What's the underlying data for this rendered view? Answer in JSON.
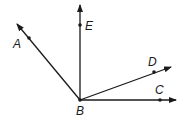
{
  "diagram": {
    "type": "rays-from-common-vertex",
    "vertex": {
      "label": "B",
      "x": 80,
      "y": 100,
      "label_x": 76,
      "label_y": 115
    },
    "rays": [
      {
        "id": "BA",
        "end_x": 17,
        "end_y": 24,
        "point": {
          "label": "A",
          "x": 29,
          "y": 38
        },
        "label_x": 13,
        "label_y": 48
      },
      {
        "id": "BE",
        "end_x": 80,
        "end_y": 5,
        "point": {
          "label": "E",
          "x": 80,
          "y": 25
        },
        "label_x": 85,
        "label_y": 30
      },
      {
        "id": "BD",
        "end_x": 171,
        "end_y": 67,
        "point": {
          "label": "D",
          "x": 154,
          "y": 72
        },
        "label_x": 148,
        "label_y": 66
      },
      {
        "id": "BC",
        "end_x": 176,
        "end_y": 100,
        "point": {
          "label": "C",
          "x": 160,
          "y": 100
        },
        "label_x": 155,
        "label_y": 94
      }
    ],
    "stroke_color": "#1a1a1a"
  }
}
